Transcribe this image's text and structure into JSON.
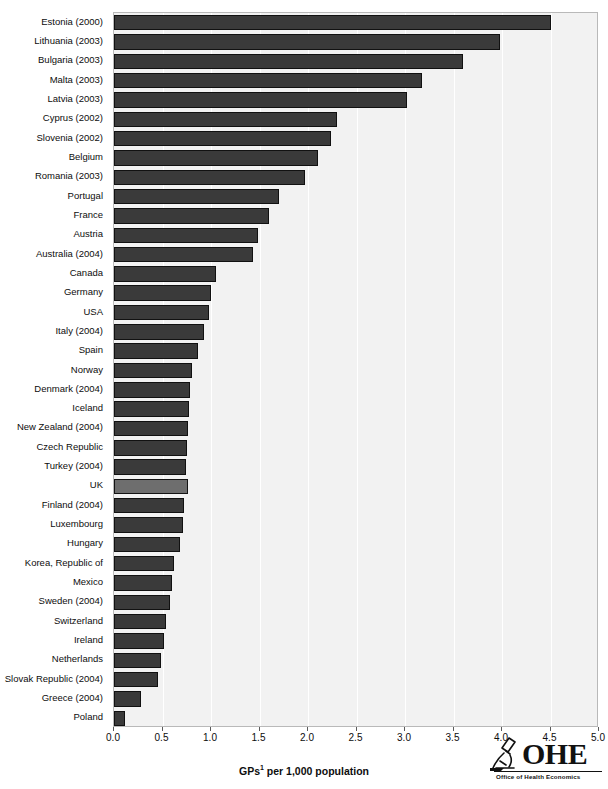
{
  "chart_data": {
    "type": "bar",
    "orientation": "horizontal",
    "title": "",
    "xlabel": "GPs¹ per 1,000 population",
    "ylabel": "",
    "xlim": [
      0.0,
      5.0
    ],
    "xticks": [
      "0.0",
      "0.5",
      "1.0",
      "1.5",
      "2.0",
      "2.5",
      "3.0",
      "3.5",
      "4.0",
      "4.5",
      "5.0"
    ],
    "xtick_values": [
      0.0,
      0.5,
      1.0,
      1.5,
      2.0,
      2.5,
      3.0,
      3.5,
      4.0,
      4.5,
      5.0
    ],
    "grid": "vertical",
    "legend": "none",
    "categories": [
      "Estonia (2000)",
      "Lithuania (2003)",
      "Bulgaria (2003)",
      "Malta (2003)",
      "Latvia (2003)",
      "Cyprus (2002)",
      "Slovenia (2002)",
      "Belgium",
      "Romania (2003)",
      "Portugal",
      "France",
      "Austria",
      "Australia (2004)",
      "Canada",
      "Germany",
      "USA",
      "Italy (2004)",
      "Spain",
      "Norway",
      "Denmark (2004)",
      "Iceland",
      "New Zealand (2004)",
      "Czech Republic",
      "Turkey (2004)",
      "UK",
      "Finland (2004)",
      "Luxembourg",
      "Hungary",
      "Korea, Republic of",
      "Mexico",
      "Sweden (2004)",
      "Switzerland",
      "Ireland",
      "Netherlands",
      "Slovak Republic (2004)",
      "Greece (2004)",
      "Poland"
    ],
    "values": [
      4.5,
      3.98,
      3.6,
      3.18,
      3.02,
      2.3,
      2.24,
      2.1,
      1.97,
      1.7,
      1.6,
      1.48,
      1.43,
      1.05,
      1.0,
      0.98,
      0.93,
      0.87,
      0.8,
      0.78,
      0.77,
      0.76,
      0.75,
      0.74,
      0.76,
      0.72,
      0.71,
      0.68,
      0.62,
      0.6,
      0.58,
      0.54,
      0.52,
      0.48,
      0.45,
      0.28,
      0.11
    ],
    "highlight_category": "UK",
    "colors": {
      "bar": "#3a3a3a",
      "bar_highlight": "#6e6e6e",
      "bar_edge": "#111111",
      "panel_background": "#f2f2f2",
      "gridline": "#ffffff",
      "panel_border": "#b9b9b9",
      "text": "#0d0d0d"
    }
  },
  "logo": {
    "name": "OHE",
    "initials": "OHE",
    "subtitle": "Office of Health Economics",
    "icon": "microscope-icon"
  }
}
